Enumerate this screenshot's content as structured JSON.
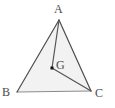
{
  "figure": {
    "type": "geometry-diagram",
    "background_color": "#ffffff",
    "fill_color": "#f2f2f2",
    "edge_color": "#4d4d4d",
    "cevian_color": "#555555",
    "base_edge_color": "#8c8c8c",
    "point_color": "#111111",
    "label_color": "#4a4a4a",
    "width": 115,
    "height": 108
  },
  "points": {
    "A": {
      "label": "A",
      "x": 59,
      "y": 20,
      "label_x": 58,
      "label_y": 10
    },
    "B": {
      "label": "B",
      "x": 17,
      "y": 92,
      "label_x": 7,
      "label_y": 93
    },
    "C": {
      "label": "C",
      "x": 91,
      "y": 91,
      "label_x": 99,
      "label_y": 94
    },
    "G": {
      "label": "G",
      "x": 52,
      "y": 68,
      "label_x": 60,
      "label_y": 66
    }
  },
  "polygon": {
    "name": "triangle-ABC",
    "points_attr": "59,20 17,92 91,91"
  },
  "segments": [
    {
      "name": "segment-AB",
      "x1": 59,
      "y1": 20,
      "x2": 17,
      "y2": 92
    },
    {
      "name": "segment-AC",
      "x1": 59,
      "y1": 20,
      "x2": 91,
      "y2": 91
    },
    {
      "name": "segment-BC",
      "x1": 17,
      "y1": 92,
      "x2": 91,
      "y2": 91
    },
    {
      "name": "segment-AG",
      "x1": 59,
      "y1": 20,
      "x2": 52,
      "y2": 68
    },
    {
      "name": "segment-GC",
      "x1": 52,
      "y1": 68,
      "x2": 91,
      "y2": 91
    }
  ],
  "marker": {
    "name": "point-G-marker",
    "shape": "square",
    "x": 52,
    "y": 68,
    "size": 3
  }
}
